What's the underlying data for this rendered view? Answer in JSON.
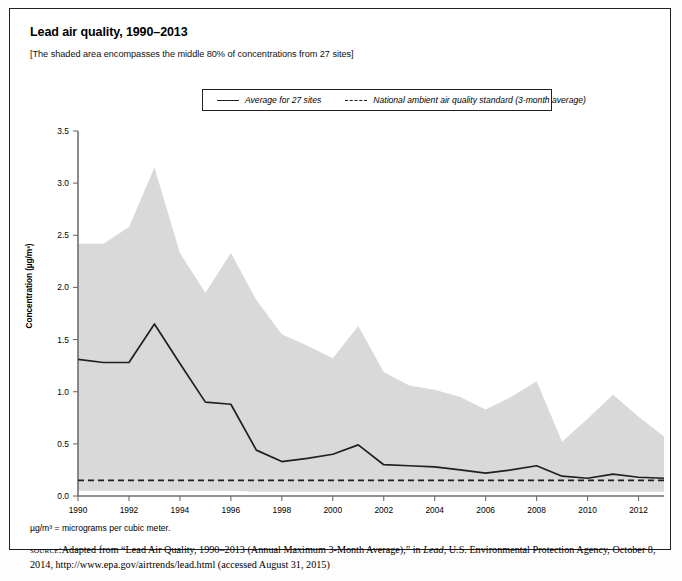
{
  "figure": {
    "title": "Lead air quality, 1990–2013",
    "subhead": "[The shaded area encompasses the middle 80% of concentrations from 27 sites]",
    "units_note": "µg/m³ = micrograms per cubic meter.",
    "source_label": "source:",
    "source_text_1": "Adapted from “Lead Air Quality, 1990–2013 (Annual Maximum 3-Month Average),” in ",
    "source_italic": "Lead",
    "source_text_2": ", U.S. Environmental Protection Agency,",
    "source_text_3": "October 8, 2014, http://www.epa.gov/airtrends/lead.html (accessed August 31, 2015)"
  },
  "legend": {
    "series_label": "Average for 27 sites",
    "standard_label": "National ambient air quality standard (3-month average)"
  },
  "colors": {
    "band_fill": "#d9d9d9",
    "line": "#231f20",
    "axis": "#6d6e71",
    "frame": "#231f20"
  },
  "chart_data": {
    "type": "area",
    "title": "Lead air quality, 1990–2013",
    "subtitle": "[The shaded area encompasses the middle 80% of concentrations from 27 sites]",
    "xlabel": "",
    "ylabel": "Concentration (µg/m³)",
    "ylim": [
      0.0,
      3.5
    ],
    "xlim": [
      1990,
      2013
    ],
    "yticks": [
      0.0,
      0.5,
      1.0,
      1.5,
      2.0,
      2.5,
      3.0,
      3.5
    ],
    "ytick_labels": [
      "0.0",
      "0.5",
      "1.0",
      "1.5",
      "2.0",
      "2.5",
      "3.0",
      "3.5"
    ],
    "xticks": [
      1990,
      1992,
      1994,
      1996,
      1998,
      2000,
      2002,
      2004,
      2006,
      2008,
      2010,
      2012
    ],
    "xtick_labels": [
      "1990",
      "1992",
      "1994",
      "1996",
      "1998",
      "2000",
      "2002",
      "2004",
      "2006",
      "2008",
      "2010",
      "2012"
    ],
    "grid": false,
    "legend_position": "top-center",
    "x": [
      1990,
      1991,
      1992,
      1993,
      1994,
      1995,
      1996,
      1997,
      1998,
      1999,
      2000,
      2001,
      2002,
      2003,
      2004,
      2005,
      2006,
      2007,
      2008,
      2009,
      2010,
      2011,
      2012,
      2013
    ],
    "series": [
      {
        "name": "Average for 27 sites",
        "type": "line",
        "values": [
          1.31,
          1.28,
          1.28,
          1.65,
          1.27,
          0.9,
          0.88,
          0.44,
          0.33,
          0.36,
          0.4,
          0.49,
          0.3,
          0.29,
          0.28,
          0.25,
          0.22,
          0.25,
          0.29,
          0.19,
          0.17,
          0.21,
          0.18,
          0.17
        ]
      },
      {
        "name": "90th percentile (upper edge of shaded band)",
        "type": "band-upper",
        "values": [
          2.42,
          2.42,
          2.58,
          3.15,
          2.33,
          1.95,
          2.33,
          1.88,
          1.55,
          1.44,
          1.32,
          1.63,
          1.19,
          1.06,
          1.02,
          0.95,
          0.83,
          0.95,
          1.1,
          0.52,
          0.74,
          0.97,
          0.76,
          0.57
        ]
      },
      {
        "name": "10th percentile (lower edge of shaded band)",
        "type": "band-lower",
        "values": [
          0.05,
          0.05,
          0.05,
          0.05,
          0.05,
          0.05,
          0.05,
          0.04,
          0.04,
          0.04,
          0.04,
          0.04,
          0.04,
          0.04,
          0.04,
          0.04,
          0.04,
          0.04,
          0.04,
          0.04,
          0.04,
          0.04,
          0.04,
          0.04
        ]
      },
      {
        "name": "National ambient air quality standard (3-month average)",
        "type": "hline",
        "value": 0.15
      }
    ],
    "annotations": []
  }
}
